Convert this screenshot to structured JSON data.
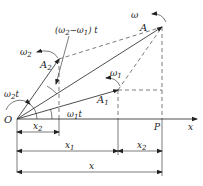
{
  "diagram": {
    "colors": {
      "line": "#222222",
      "background": "#ffffff"
    },
    "labels": {
      "omega": "ω",
      "A": "A",
      "omega2": "ω",
      "omega2_sub": "2",
      "A2": "A",
      "A2_sub": "2",
      "diff_angle": "(ω₂−ω₁) t",
      "omega1": "ω",
      "omega1_sub": "1",
      "A1": "A",
      "A1_sub": "1",
      "omega2t": "ω₂t",
      "omega1t": "ω₁t",
      "origin": "O",
      "P": "P",
      "x_axis": "x",
      "x2_left": "x",
      "x2_left_sub": "2",
      "x2_right": "x",
      "x2_right_sub": "2",
      "x1": "x",
      "x1_sub": "1",
      "x_total": "x"
    }
  }
}
